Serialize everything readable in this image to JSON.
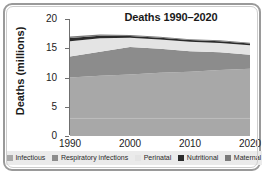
{
  "chart_data": {
    "type": "area",
    "stacked": true,
    "title": "Deaths 1990–2020",
    "xlabel": "",
    "ylabel": "Deaths (millions)",
    "x": [
      1990,
      1995,
      2000,
      2005,
      2010,
      2015,
      2020
    ],
    "xlim": [
      1990,
      2020
    ],
    "ylim": [
      0,
      20
    ],
    "yticks": [
      0,
      5,
      10,
      15,
      20
    ],
    "xticks": [
      1990,
      2000,
      2010,
      2020
    ],
    "xtick_labels": [
      "1990",
      "2000",
      "2010",
      "2020"
    ],
    "ytick_labels": [
      "0",
      "5",
      "10",
      "15",
      "20"
    ],
    "grid": false,
    "legend_position": "bottom",
    "series": [
      {
        "name": "Infectious",
        "color": "#a8a8a8",
        "values": [
          10.0,
          10.3,
          10.5,
          10.8,
          11.0,
          11.3,
          11.5
        ]
      },
      {
        "name": "Respiratory infections",
        "color": "#8c8c8c",
        "values": [
          3.6,
          4.1,
          4.7,
          4.1,
          3.5,
          3.0,
          2.4
        ]
      },
      {
        "name": "Perinatal",
        "color": "#e4e4e4",
        "values": [
          2.6,
          2.3,
          1.6,
          1.6,
          1.6,
          1.6,
          1.6
        ]
      },
      {
        "name": "Nutritional",
        "color": "#2b2b2b",
        "values": [
          0.55,
          0.45,
          0.3,
          0.3,
          0.3,
          0.3,
          0.3
        ]
      },
      {
        "name": "Maternal",
        "color": "#7a7a7a",
        "values": [
          0.25,
          0.2,
          0.15,
          0.15,
          0.15,
          0.15,
          0.15
        ]
      }
    ],
    "totals": [
      17.0,
      17.35,
      17.25,
      16.95,
      16.55,
      16.35,
      15.95
    ]
  },
  "legend": {
    "items": [
      {
        "label": "Infectious",
        "color": "#a8a8a8"
      },
      {
        "label": "Respiratory infections",
        "color": "#8c8c8c"
      },
      {
        "label": "Perinatal",
        "color": "#e4e4e4"
      },
      {
        "label": "Nutritional",
        "color": "#2b2b2b"
      },
      {
        "label": "Maternal",
        "color": "#7a7a7a"
      }
    ]
  },
  "colors": {
    "frame_border": "#9a9a9a",
    "legend_background": "#ebebeb",
    "axis": "#6f6f6f",
    "text": "#1a1a1a",
    "plot_background": "#ffffff"
  }
}
